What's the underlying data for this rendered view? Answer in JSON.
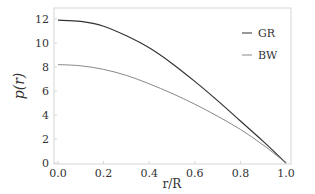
{
  "chart_data": {
    "type": "line",
    "title": "",
    "xlabel": "r/R",
    "ylabel": "p(r)",
    "xlim": [
      0.0,
      1.0
    ],
    "ylim": [
      0,
      12.4
    ],
    "x_ticks": [
      "0.0",
      "0.2",
      "0.4",
      "0.6",
      "0.8",
      "1.0"
    ],
    "y_ticks": [
      "0",
      "2",
      "4",
      "6",
      "8",
      "10",
      "12"
    ],
    "grid": false,
    "legend_position": "upper right",
    "x": [
      0.0,
      0.1,
      0.2,
      0.3,
      0.4,
      0.5,
      0.6,
      0.7,
      0.8,
      0.9,
      1.0
    ],
    "series": [
      {
        "name": "GR",
        "color": "#333333",
        "values": [
          11.9,
          11.8,
          11.4,
          10.6,
          9.6,
          8.3,
          6.8,
          5.2,
          3.5,
          1.8,
          0.0
        ]
      },
      {
        "name": "BW",
        "color": "#888888",
        "values": [
          8.2,
          8.1,
          7.8,
          7.3,
          6.6,
          5.8,
          4.9,
          3.9,
          2.8,
          1.5,
          0.0
        ]
      }
    ]
  }
}
